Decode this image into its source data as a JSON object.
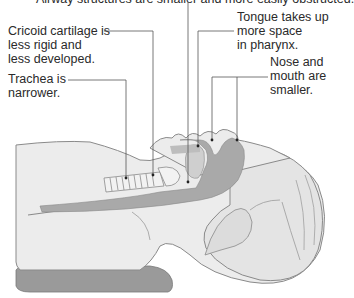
{
  "title": "Airway structures are smaller and more easily obstructed.",
  "labels": {
    "cricoid": "Cricoid cartilage is\nless rigid and\nless developed.",
    "trachea": "Trachea is\nnarrower.",
    "tongue": "Tongue takes up\nmore space\nin pharynx.",
    "nose_mouth": "Nose and\nmouth are\nsmaller."
  },
  "colors": {
    "skin": "#ececec",
    "skin_outline": "#8a8a8a",
    "airway": "#a9a9a9",
    "tongue": "#cfcfcf",
    "leader": "#555555",
    "pillow": "#9a9a9a"
  }
}
